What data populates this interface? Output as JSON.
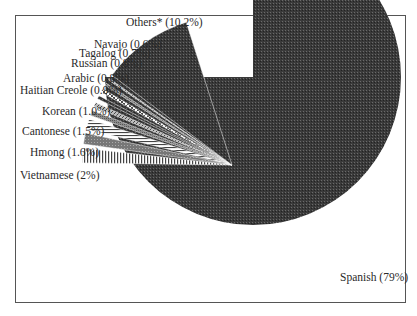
{
  "chart_data": {
    "type": "pie",
    "title": "",
    "exploded": true,
    "categories": [
      "Spanish",
      "Others*",
      "Navajo",
      "Tagalog",
      "Russian",
      "Arabic",
      "Haitian Creole",
      "Korean",
      "Cantonese",
      "Hmong",
      "Vietnamese"
    ],
    "values": [
      79,
      10.2,
      0.6,
      0.7,
      0.8,
      0.8,
      0.9,
      1.0,
      1.5,
      1.6,
      2
    ],
    "labels": [
      "Spanish (79%)",
      "Others* (10.2%)",
      "Navajo (0.6%)",
      "Tagalog (0.7%)",
      "Russian (0.8%)",
      "Arabic (0.8%)",
      "Haitian Creole (0.9%)",
      "Korean (1.0%)",
      "Cantonese (1.5%)",
      "Hmong (1.6%)",
      "Vietnamese (2%)"
    ],
    "legend": "none (direct labels)",
    "grid": false
  },
  "labels": {
    "spanish": "Spanish (79%)",
    "others": "Others* (10.2%)",
    "navajo": "Navajo (0.6%)",
    "tagalog": "Tagalog (0.7%)",
    "russian": "Russian (0.8%)",
    "arabic": "Arabic (0.8%)",
    "haitian": "Haitian Creole (0.9%)",
    "korean": "Korean (1.0%)",
    "cantonese": "Cantonese (1.5%)",
    "hmong": "Hmong (1.6%)",
    "vietnamese": "Vietnamese (2%)"
  }
}
